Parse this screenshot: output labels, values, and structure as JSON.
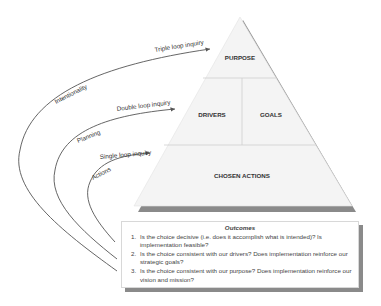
{
  "diagram": {
    "pyramid": {
      "levels": [
        {
          "label": "PURPOSE"
        },
        {
          "label": "DRIVERS"
        },
        {
          "label": "GOALS"
        },
        {
          "label": "CHOSEN ACTIONS"
        }
      ]
    },
    "loops": [
      {
        "arrow_label": "Triple loop inquiry",
        "curve_label": "Intentionality"
      },
      {
        "arrow_label": "Double loop inquiry",
        "curve_label": "Planning"
      },
      {
        "arrow_label": "Single loop inquiry",
        "curve_label": "Actions"
      }
    ],
    "outcomes": {
      "title": "Outcomes",
      "items": [
        "Is the choice decisive (i.e. does it accomplish what is intended)?  Is implementation feasible?",
        "Is the choice consistent with our drivers?  Does implementation reinforce our strategic goals?",
        "Is the choice consistent with our purpose?  Does implementation reinforce our vision and mission?"
      ]
    },
    "colors": {
      "line": "#555555",
      "pyramid_fill": "#f4f4f4",
      "shadow": "#8a8a8a"
    }
  }
}
